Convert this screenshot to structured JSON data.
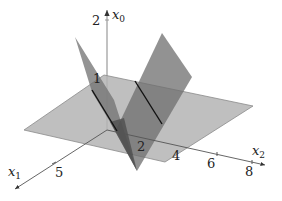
{
  "diagram": {
    "title": "",
    "axes": {
      "x0": {
        "label": "x",
        "subscript": "0",
        "ticks": [
          "1",
          "2"
        ]
      },
      "x1": {
        "label": "x",
        "subscript": "1",
        "ticks": [
          "5"
        ]
      },
      "x2": {
        "label": "x",
        "subscript": "2",
        "ticks": [
          "2",
          "4",
          "6",
          "8"
        ]
      }
    },
    "colors": {
      "horizontal_plane": "#b4b4b4",
      "left_plane": "#6e6e6e",
      "right_plane": "#7a7a7a",
      "overlap": "#4e4e4e",
      "axis": "#555555",
      "intersection_line": "#111111",
      "background": "#ffffff"
    }
  }
}
